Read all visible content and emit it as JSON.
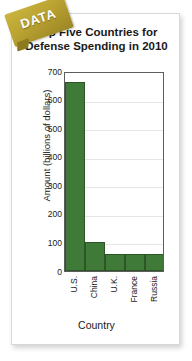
{
  "badge": {
    "label": "DATA",
    "color": "#b9a231"
  },
  "chart_data": {
    "type": "bar",
    "title": "Top Five Countries for Defense Spending in 2010",
    "title_line1": "Top Five Countries for",
    "title_line2": "Defense Spending in 2010",
    "xlabel": "Country",
    "ylabel": "Amount (billions of dollars)",
    "categories": [
      "U.S.",
      "China",
      "U.K.",
      "France",
      "Russia"
    ],
    "values": [
      660,
      100,
      60,
      60,
      58
    ],
    "ylim": [
      0,
      700
    ],
    "yticks": [
      700,
      600,
      500,
      400,
      300,
      200,
      100,
      0
    ],
    "grid": true,
    "legend": false,
    "bar_color": "#3f7a38",
    "bar_edge_color": "#2c5626"
  }
}
